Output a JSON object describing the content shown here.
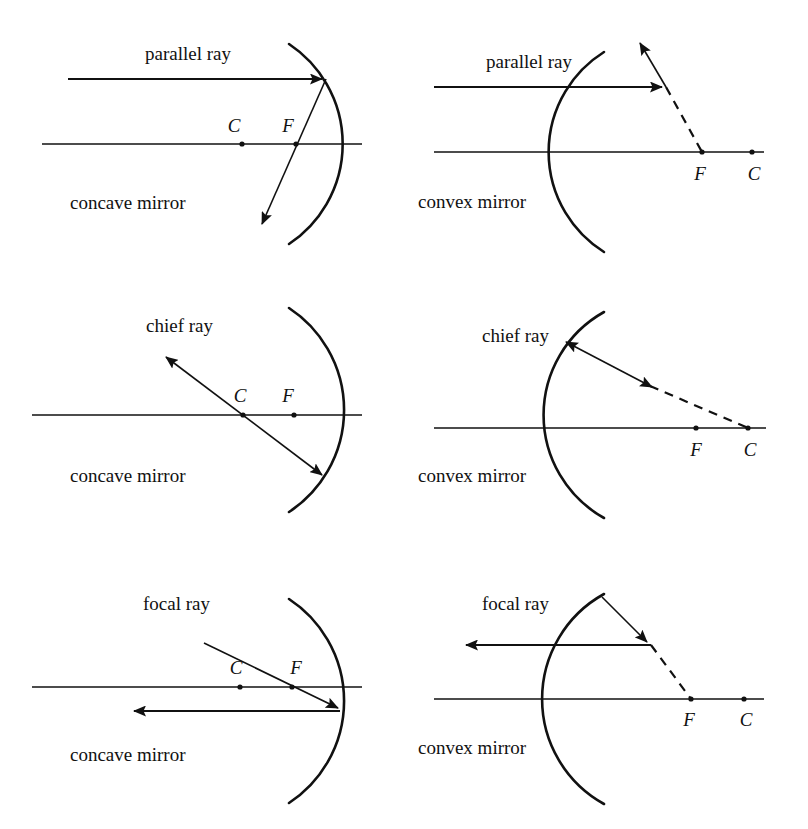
{
  "figure": {
    "background_color": "#ffffff",
    "ink_color": "#111111",
    "width": 808,
    "height": 829
  },
  "panels": [
    {
      "id": "concave-parallel",
      "ray_label": "parallel ray",
      "mirror_label": "concave mirror",
      "mirror_type": "concave",
      "ray_type": "parallel",
      "points": {
        "center_label": "C",
        "focus_label": "F"
      },
      "description": "Incoming parallel ray reflects through F"
    },
    {
      "id": "convex-parallel",
      "ray_label": "parallel ray",
      "mirror_label": "convex mirror",
      "mirror_type": "convex",
      "ray_type": "parallel",
      "points": {
        "center_label": "C",
        "focus_label": "F"
      },
      "description": "Incoming parallel ray reflects as if from F behind mirror"
    },
    {
      "id": "concave-chief",
      "ray_label": "chief ray",
      "mirror_label": "concave mirror",
      "mirror_type": "concave",
      "ray_type": "chief",
      "points": {
        "center_label": "C",
        "focus_label": "F"
      },
      "description": "Chief ray passes through C and reflects back on itself"
    },
    {
      "id": "convex-chief",
      "ray_label": "chief ray",
      "mirror_label": "convex mirror",
      "mirror_type": "convex",
      "ray_type": "chief",
      "points": {
        "center_label": "C",
        "focus_label": "F"
      },
      "description": "Chief ray aimed at C reflects back on itself"
    },
    {
      "id": "concave-focal",
      "ray_label": "focal ray",
      "mirror_label": "concave mirror",
      "mirror_type": "concave",
      "ray_type": "focal",
      "points": {
        "center_label": "C",
        "focus_label": "F"
      },
      "description": "Ray through F reflects parallel to the axis"
    },
    {
      "id": "convex-focal",
      "ray_label": "focal ray",
      "mirror_label": "convex mirror",
      "mirror_type": "convex",
      "ray_type": "focal",
      "points": {
        "center_label": "C",
        "focus_label": "F"
      },
      "description": "Ray aimed at F reflects parallel to the axis"
    }
  ]
}
